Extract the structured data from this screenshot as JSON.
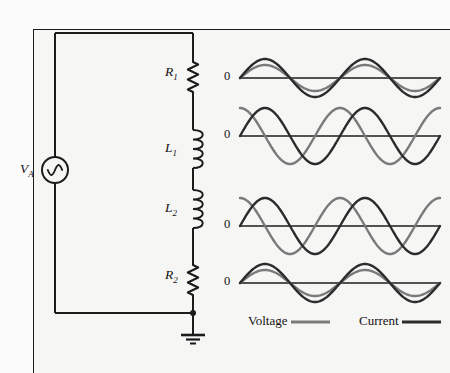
{
  "figure": {
    "background_color": "#f6f6f4",
    "frame_color": "#1c1c1c"
  },
  "colors": {
    "wire": "#1c1c1c",
    "voltage": "#7a7a7a",
    "current": "#2b2b2b",
    "text": "#121212"
  },
  "circuit": {
    "source": {
      "label_main": "V",
      "label_sub": "A",
      "symbol": "ac-source-sine",
      "cx": 55,
      "cy": 170,
      "r": 13
    },
    "components": [
      {
        "id": "R1",
        "label_main": "R",
        "label_sub": "1",
        "type": "resistor",
        "x": 193,
        "y_top": 62,
        "y_bottom": 92
      },
      {
        "id": "L1",
        "label_main": "L",
        "label_sub": "1",
        "type": "inductor",
        "x": 193,
        "y_top": 130,
        "y_bottom": 168
      },
      {
        "id": "L2",
        "label_main": "L",
        "label_sub": "2",
        "type": "inductor",
        "x": 193,
        "y_top": 190,
        "y_bottom": 228
      },
      {
        "id": "R2",
        "label_main": "R",
        "label_sub": "2",
        "type": "resistor",
        "x": 193,
        "y_top": 265,
        "y_bottom": 295
      }
    ],
    "ground": {
      "symbol": "earth-ground",
      "x": 193,
      "y": 313
    },
    "node_dot": {
      "x": 193,
      "y": 313
    },
    "wire_path": {
      "left_x": 55,
      "right_x": 193,
      "top_y": 33,
      "bottom_y": 313
    }
  },
  "waveforms": {
    "axis_label": "0",
    "x_start": 240,
    "x_end": 440,
    "cycles": 2,
    "panels": [
      {
        "id": "wave-R1",
        "component": "R1",
        "baseline_y": 78,
        "phase_note": "in-phase",
        "voltage": {
          "amplitude": 13,
          "phase_deg": 0
        },
        "current": {
          "amplitude": 19,
          "phase_deg": 0
        }
      },
      {
        "id": "wave-L1",
        "component": "L1",
        "baseline_y": 136,
        "phase_note": "voltage-leads-current-90",
        "voltage": {
          "amplitude": 28,
          "phase_deg": 90
        },
        "current": {
          "amplitude": 28,
          "phase_deg": 0
        }
      },
      {
        "id": "wave-L2",
        "component": "L2",
        "baseline_y": 226,
        "phase_note": "voltage-leads-current-90",
        "voltage": {
          "amplitude": 28,
          "phase_deg": 90
        },
        "current": {
          "amplitude": 28,
          "phase_deg": 0
        }
      },
      {
        "id": "wave-R2",
        "component": "R2",
        "baseline_y": 283,
        "phase_note": "in-phase",
        "voltage": {
          "amplitude": 13,
          "phase_deg": 0
        },
        "current": {
          "amplitude": 19,
          "phase_deg": 0
        }
      }
    ]
  },
  "legend": {
    "items": [
      {
        "label": "Voltage",
        "color": "#7a7a7a",
        "label_x": 248,
        "label_y": 322,
        "line_x1": 291,
        "line_x2": 330,
        "line_y": 322
      },
      {
        "label": "Current",
        "color": "#2b2b2b",
        "label_x": 359,
        "label_y": 322,
        "line_x1": 402,
        "line_x2": 441,
        "line_y": 322
      }
    ]
  },
  "chart_data": {
    "type": "line",
    "xlabel": "",
    "ylabel": "",
    "series": [
      {
        "name": "Voltage across R1",
        "waveform": "sine",
        "amplitude": 13,
        "phase_deg": 0,
        "color": "#7a7a7a"
      },
      {
        "name": "Current through R1",
        "waveform": "sine",
        "amplitude": 19,
        "phase_deg": 0,
        "color": "#2b2b2b"
      },
      {
        "name": "Voltage across L1",
        "waveform": "sine",
        "amplitude": 28,
        "phase_deg": 90,
        "color": "#7a7a7a"
      },
      {
        "name": "Current through L1",
        "waveform": "sine",
        "amplitude": 28,
        "phase_deg": 0,
        "color": "#2b2b2b"
      },
      {
        "name": "Voltage across L2",
        "waveform": "sine",
        "amplitude": 28,
        "phase_deg": 90,
        "color": "#7a7a7a"
      },
      {
        "name": "Current through L2",
        "waveform": "sine",
        "amplitude": 28,
        "phase_deg": 0,
        "color": "#2b2b2b"
      },
      {
        "name": "Voltage across R2",
        "waveform": "sine",
        "amplitude": 13,
        "phase_deg": 0,
        "color": "#7a7a7a"
      },
      {
        "name": "Current through R2",
        "waveform": "sine",
        "amplitude": 19,
        "phase_deg": 0,
        "color": "#2b2b2b"
      }
    ],
    "legend": [
      "Voltage",
      "Current"
    ],
    "legend_position": "bottom",
    "grid": false,
    "tick_labels": [
      "0",
      "0",
      "0",
      "0"
    ]
  }
}
